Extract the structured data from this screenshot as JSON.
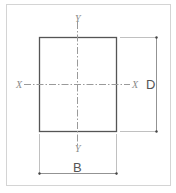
{
  "diagram": {
    "axis_labels": {
      "x_left": "X",
      "x_right": "X",
      "y_top": "Y",
      "y_bottom": "Y"
    },
    "dimensions": {
      "depth": "D",
      "breadth": "B"
    },
    "colors": {
      "outline": "#555555",
      "axis": "#9a9a9a",
      "frame": "#d4d4d4"
    }
  }
}
